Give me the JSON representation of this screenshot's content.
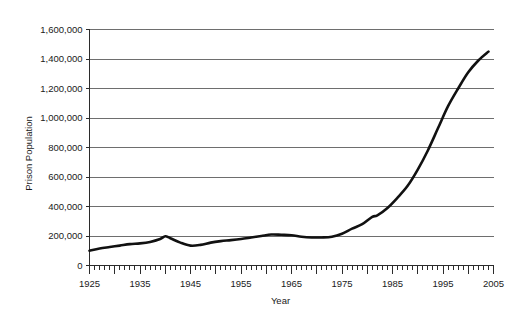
{
  "chart_data": {
    "type": "line",
    "title": "",
    "subtitle": "",
    "xlabel": "Year",
    "ylabel": "Prison Population",
    "xlim": [
      1925,
      2005
    ],
    "ylim": [
      0,
      1600000
    ],
    "grid": true,
    "legend": false,
    "legend_position": "none",
    "x_tick_labels": [
      "1925",
      "1935",
      "1945",
      "1955",
      "1965",
      "1975",
      "1985",
      "1995",
      "2005"
    ],
    "x_ticks": [
      1925,
      1935,
      1945,
      1955,
      1965,
      1975,
      1985,
      1995,
      2005
    ],
    "x_minor_tick_interval": 1,
    "x_major_tick_interval": 5,
    "y_tick_labels": [
      "0",
      "200,000",
      "400,000",
      "600,000",
      "800,000",
      "1,000,000",
      "1,200,000",
      "1,400,000",
      "1,600,000"
    ],
    "y_ticks": [
      0,
      200000,
      400000,
      600000,
      800000,
      1000000,
      1200000,
      1400000,
      1600000
    ],
    "line_color": "#111111",
    "gridline_color": "#6e6e6e",
    "axis_color": "#2b2b2b",
    "background_color": "#ffffff",
    "series": [
      {
        "name": "Prison Population",
        "x": [
          1925,
          1927,
          1929,
          1931,
          1933,
          1935,
          1937,
          1939,
          1940,
          1941,
          1943,
          1945,
          1947,
          1949,
          1951,
          1953,
          1955,
          1957,
          1959,
          1961,
          1963,
          1965,
          1967,
          1969,
          1971,
          1973,
          1975,
          1977,
          1979,
          1981,
          1982,
          1984,
          1986,
          1988,
          1990,
          1992,
          1994,
          1996,
          1998,
          2000,
          2002,
          2004
        ],
        "values": [
          100000,
          115000,
          125000,
          135000,
          145000,
          150000,
          160000,
          180000,
          198000,
          185000,
          155000,
          135000,
          140000,
          155000,
          165000,
          172000,
          180000,
          190000,
          200000,
          210000,
          208000,
          205000,
          195000,
          190000,
          190000,
          195000,
          215000,
          250000,
          280000,
          330000,
          340000,
          390000,
          460000,
          540000,
          650000,
          780000,
          930000,
          1080000,
          1200000,
          1310000,
          1390000,
          1450000
        ]
      }
    ],
    "annotations": []
  }
}
